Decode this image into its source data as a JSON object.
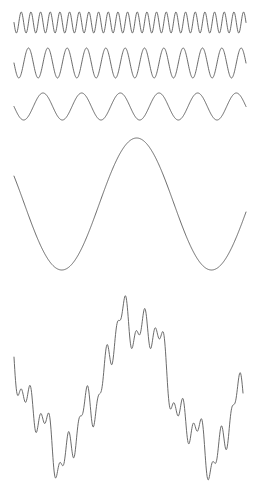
{
  "figure": {
    "title": "",
    "background_color": "#ffffff",
    "stroke_color": "#5a5a5a",
    "stroke_width": 0.9,
    "width": 258,
    "height": 481,
    "plot_left": 14,
    "plot_right": 246
  },
  "chart_data": {
    "type": "line",
    "title": "",
    "subtitle": "",
    "xlabel": "",
    "ylabel": "",
    "grid": false,
    "legend": "none",
    "axis_visible": false,
    "tick_labels": [],
    "annotations": [],
    "x": {
      "min": 0,
      "max": 1,
      "samples": 600
    },
    "series": [
      {
        "name": "harmonic-1",
        "waveform": "sine",
        "cycles": 24,
        "amplitude": 10.5,
        "phase_deg": 180,
        "baseline_y": 22.5,
        "y_top": 12,
        "y_bottom": 33,
        "x_start": 14,
        "x_end": 246
      },
      {
        "name": "harmonic-2",
        "waveform": "sine",
        "cycles": 12,
        "amplitude": 15,
        "phase_deg": 180,
        "baseline_y": 63,
        "y_top": 48,
        "y_bottom": 78,
        "x_start": 14,
        "x_end": 246
      },
      {
        "name": "harmonic-3",
        "waveform": "sine",
        "cycles": 6,
        "amplitude": 13.5,
        "phase_deg": 180,
        "baseline_y": 106.5,
        "y_top": 93,
        "y_bottom": 120,
        "x_start": 14,
        "x_end": 246
      },
      {
        "name": "harmonic-4",
        "waveform": "sine",
        "cycles": 1.55,
        "amplitude": 66,
        "phase_deg": 155,
        "baseline_y": 204,
        "y_top": 138,
        "y_bottom": 270,
        "x_start": 14,
        "x_end": 246
      },
      {
        "name": "composite-sum",
        "waveform": "sum-of-harmonics",
        "components": [
          {
            "cycles": 24,
            "amplitude": 10.5,
            "phase_deg": 180
          },
          {
            "cycles": 12,
            "amplitude": 15,
            "phase_deg": 180
          },
          {
            "cycles": 6,
            "amplitude": 13.5,
            "phase_deg": 180
          },
          {
            "cycles": 1.55,
            "amplitude": 66,
            "phase_deg": 155
          }
        ],
        "baseline_y": 385,
        "y_top": 292,
        "y_bottom": 462,
        "x_start": 14,
        "x_end": 243
      }
    ]
  }
}
